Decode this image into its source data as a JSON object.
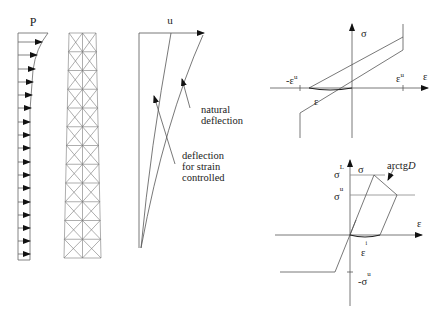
{
  "load_panel": {
    "label": "P",
    "arrow_count": 11
  },
  "frame_panel": {
    "rows": 12,
    "columns": 2
  },
  "deflection_panel": {
    "axis_label": "u",
    "annotation_natural_line1": "natural",
    "annotation_natural_line2": "deflection",
    "annotation_strain_line1": "deflection",
    "annotation_strain_line2": "for strain",
    "annotation_strain_line3": "controlled"
  },
  "top_chart": {
    "y_label": "σ",
    "x_label": "ε",
    "neg_tick_label": "-ε",
    "neg_tick_sup": "u",
    "pos_tick_label": "ε",
    "pos_tick_sup": "u",
    "residual_label": "ε"
  },
  "bottom_chart": {
    "y_label": "σ",
    "x_label": "ε",
    "sigma_L": "σ",
    "sigma_L_sup": "L",
    "sigma_u": "σ",
    "sigma_u_sup": "u",
    "neg_sigma_u": "-σ",
    "neg_sigma_u_sup": "u",
    "slope_label": "arctg",
    "slope_label_italic": "D",
    "residual_label": "ε",
    "residual_sup": "i"
  },
  "colors": {
    "line": "#555555",
    "dark": "#111111",
    "background": "#ffffff"
  }
}
